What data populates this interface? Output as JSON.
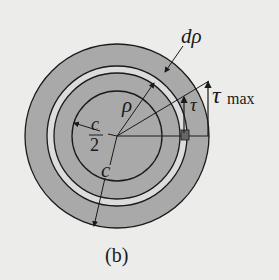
{
  "figure": {
    "caption": "(b)",
    "labels": {
      "d_rho": "dρ",
      "rho": "ρ",
      "tau": "τ",
      "tau_max_symbol": "τ",
      "tau_max_subscript": "max",
      "c_over_2_num": "c",
      "c_over_2_den": "2",
      "c": "c"
    },
    "colors": {
      "background": "#ececea",
      "shaded": "#a9a9a9",
      "ring_light": "#dcdcdc",
      "line": "#1a1a1a",
      "element": "#666666"
    }
  }
}
